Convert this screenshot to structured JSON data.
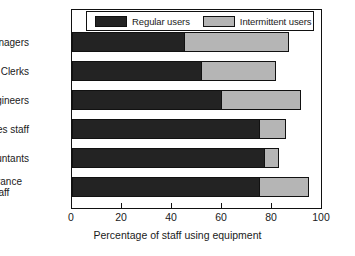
{
  "chart_data": {
    "type": "bar",
    "orientation": "horizontal",
    "stacked": true,
    "title": "",
    "xlabel": "Percentage of staff using equipment",
    "ylabel": "",
    "xlim": [
      0,
      100
    ],
    "xticks": [
      0,
      20,
      40,
      60,
      80,
      100
    ],
    "xtick_labels": [
      "0",
      "20",
      "40",
      "60",
      "80",
      "100"
    ],
    "grid": false,
    "legend_position": "top-inside",
    "categories": [
      "Managers",
      "Clerks",
      "Engineers",
      "Sales staff",
      "Accountants",
      "Insurance staff"
    ],
    "series": [
      {
        "name": "Regular users",
        "color": "#232323",
        "values": [
          45,
          52,
          60,
          75,
          77,
          75
        ]
      },
      {
        "name": "Intermittent users",
        "color": "#b5b5b5",
        "values": [
          42,
          30,
          32,
          11,
          6,
          20
        ]
      }
    ],
    "totals": [
      87,
      82,
      92,
      86,
      83,
      95
    ]
  },
  "legend": {
    "entries": [
      {
        "label": "Regular users",
        "swatch": "#232323"
      },
      {
        "label": "Intermittent users",
        "swatch": "#b5b5b5"
      }
    ]
  },
  "axis": {
    "x_title": "Percentage of staff using equipment",
    "tick_0": "0",
    "tick_1": "20",
    "tick_2": "40",
    "tick_3": "60",
    "tick_4": "80",
    "tick_5": "100"
  },
  "category_labels": {
    "managers": "Managers",
    "clerks": "Clerks",
    "engineers": "Engineers",
    "sales_staff": "Sales staff",
    "accountants": "Accountants",
    "insurance_staff": "Insurance staff"
  }
}
